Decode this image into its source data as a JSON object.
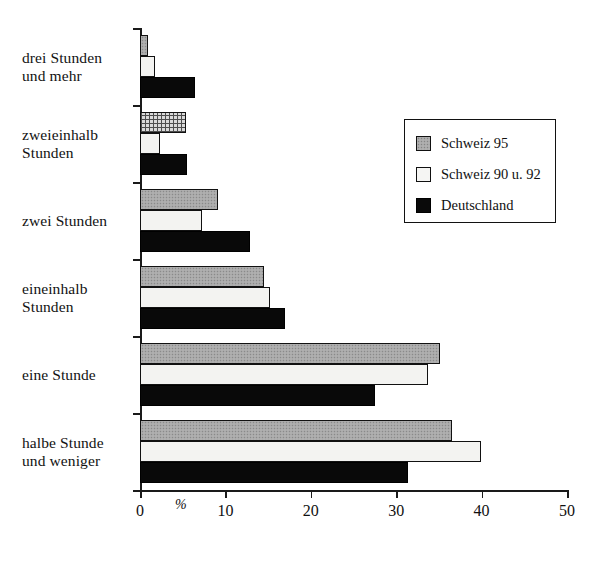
{
  "chart_data": {
    "type": "bar",
    "orientation": "horizontal",
    "title": "",
    "xlabel": "%",
    "ylabel": "",
    "xlim": [
      0,
      50
    ],
    "xticks": [
      0,
      10,
      20,
      30,
      40,
      50
    ],
    "xticklabels": [
      "0",
      "10",
      "20",
      "30",
      "40",
      "50"
    ],
    "grid": false,
    "legend_position": "upper right",
    "categories": [
      "drei Stunden und mehr",
      "zweieinhalb Stunden",
      "zwei Stunden",
      "eineinhalb Stunden",
      "eine Stunde",
      "halbe Stunde und weniger"
    ],
    "category_lines": [
      [
        "drei Stunden",
        "und mehr"
      ],
      [
        "zweieinhalb",
        "Stunden"
      ],
      [
        "zwei Stunden"
      ],
      [
        "eineinhalb",
        "Stunden"
      ],
      [
        "eine Stunde"
      ],
      [
        "halbe Stunde",
        "und weniger"
      ]
    ],
    "series": [
      {
        "name": "Schweiz 95",
        "color": "#a8a8a8",
        "values": [
          0.9,
          5.4,
          9.1,
          14.5,
          35.1,
          36.5
        ]
      },
      {
        "name": "Schweiz 90 u. 92",
        "color": "#f3f3f1",
        "values": [
          1.7,
          2.3,
          7.3,
          15.2,
          33.7,
          39.9
        ]
      },
      {
        "name": "Deutschland",
        "color": "#090909",
        "values": [
          6.4,
          5.5,
          12.9,
          17.0,
          27.5,
          31.4
        ]
      }
    ]
  },
  "legend": {
    "entries": [
      {
        "label": "Schweiz 95"
      },
      {
        "label": "Schweiz 90 u. 92"
      },
      {
        "label": "Deutschland"
      }
    ]
  }
}
